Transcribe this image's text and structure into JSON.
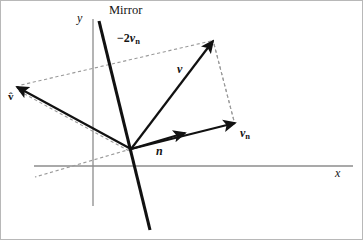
{
  "figure": {
    "width": 363,
    "height": 240,
    "background_color": "#ffffff",
    "border_color": "#b8b8b8"
  },
  "axes": {
    "color": "#8c8c8c",
    "x_axis": {
      "label": "x",
      "y": 165,
      "x_start": 33,
      "x_end": 352
    },
    "y_axis": {
      "label": "y",
      "x": 92,
      "y_start": 18,
      "y_end": 205
    },
    "origin": {
      "x": 130,
      "y": 148
    }
  },
  "mirror": {
    "label": "Mirror",
    "label_x": 108,
    "label_y": 3,
    "color": "#111111",
    "stroke_width": 3.1,
    "x1": 98,
    "y1": 20,
    "x2": 149,
    "y2": 229
  },
  "vectors": [
    {
      "name": "incident-vector",
      "label": "v",
      "label_subscript": "",
      "label_prefix": "",
      "label_x": 176,
      "label_y": 62,
      "tail_x": 130,
      "tail_y": 148,
      "tip_x": 212,
      "tip_y": 40,
      "color": "#111111",
      "stroke_width": 2.2
    },
    {
      "name": "normal-vector",
      "label": "n",
      "label_subscript": "",
      "label_prefix": "",
      "label_x": 155,
      "label_y": 144,
      "tail_x": 130,
      "tail_y": 148,
      "tip_x": 184,
      "tip_y": 132,
      "color": "#111111",
      "stroke_width": 2.2
    },
    {
      "name": "normal-component-vector",
      "label": "v",
      "label_subscript": "n",
      "label_prefix": "",
      "label_x": 239,
      "label_y": 126,
      "tail_x": 130,
      "tail_y": 148,
      "tip_x": 234,
      "tip_y": 122,
      "color": "#111111",
      "stroke_width": 2.2
    },
    {
      "name": "reflected-vector",
      "label": "v̂",
      "label_subscript": "",
      "label_prefix": "",
      "label_x": 7,
      "label_y": 90,
      "tail_x": 130,
      "tail_y": 148,
      "tip_x": 16,
      "tip_y": 86,
      "color": "#111111",
      "stroke_width": 2.2
    }
  ],
  "annotations": [
    {
      "name": "minus-two-vn-label",
      "prefix": "−2",
      "label": "v",
      "subscript": "n",
      "x": 116,
      "y": 31
    }
  ],
  "dashed_lines": [
    {
      "name": "v-tip-to-vn-tip",
      "x1": 213,
      "y1": 43,
      "x2": 233,
      "y2": 120,
      "color": "#9a9a9a"
    },
    {
      "name": "v-tip-to-reflected-tip",
      "x1": 210,
      "y1": 40,
      "x2": 20,
      "y2": 84,
      "color": "#9a9a9a"
    },
    {
      "name": "reflected-tip-to-lower-left",
      "x1": 18,
      "y1": 90,
      "x2": 128,
      "y2": 150,
      "color": "#9a9a9a"
    },
    {
      "name": "origin-to-lower-left",
      "x1": 130,
      "y1": 148,
      "x2": 34,
      "y2": 176,
      "color": "#9a9a9a"
    }
  ]
}
